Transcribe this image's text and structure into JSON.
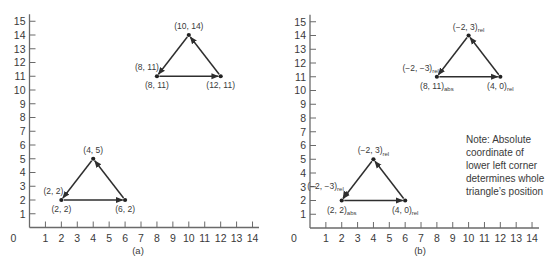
{
  "figure": {
    "panels": [
      {
        "id": "a",
        "caption": "(a)",
        "x_ticks": [
          "0",
          "1",
          "2",
          "3",
          "4",
          "5",
          "6",
          "7",
          "8",
          "9",
          "10",
          "11",
          "12",
          "13",
          "14"
        ],
        "y_ticks": [
          "1",
          "2",
          "3",
          "4",
          "5",
          "6",
          "7",
          "8",
          "9",
          "10",
          "11",
          "12",
          "13",
          "14",
          "15"
        ],
        "x_range": [
          0,
          14
        ],
        "y_range": [
          0,
          15
        ],
        "triangles": [
          {
            "name": "lower-triangle",
            "vertices": [
              [
                2,
                2
              ],
              [
                6,
                2
              ],
              [
                4,
                5
              ]
            ],
            "labels": [
              {
                "text": "(2, 2)",
                "sub": "",
                "at": [
                  2,
                  2
                ],
                "pos": "below"
              },
              {
                "text": "(2, 2)",
                "sub": "",
                "at": [
                  2,
                  2
                ],
                "pos": "above-left"
              },
              {
                "text": "(6, 2)",
                "sub": "",
                "at": [
                  6,
                  2
                ],
                "pos": "below"
              },
              {
                "text": "(4, 5)",
                "sub": "",
                "at": [
                  4,
                  5
                ],
                "pos": "above"
              }
            ]
          },
          {
            "name": "upper-triangle",
            "vertices": [
              [
                8,
                11
              ],
              [
                12,
                11
              ],
              [
                10,
                14
              ]
            ],
            "labels": [
              {
                "text": "(8, 11)",
                "sub": "",
                "at": [
                  8,
                  11
                ],
                "pos": "below"
              },
              {
                "text": "(8, 11)",
                "sub": "",
                "at": [
                  8,
                  11
                ],
                "pos": "above-left"
              },
              {
                "text": "(12, 11)",
                "sub": "",
                "at": [
                  12,
                  11
                ],
                "pos": "below"
              },
              {
                "text": "(10, 14)",
                "sub": "",
                "at": [
                  10,
                  14
                ],
                "pos": "above"
              }
            ]
          }
        ]
      },
      {
        "id": "b",
        "caption": "(b)",
        "x_ticks": [
          "0",
          "1",
          "2",
          "3",
          "4",
          "5",
          "6",
          "7",
          "8",
          "9",
          "10",
          "11",
          "12",
          "13",
          "14"
        ],
        "y_ticks": [
          "1",
          "2",
          "3",
          "4",
          "5",
          "6",
          "7",
          "8",
          "9",
          "10",
          "11",
          "12",
          "13",
          "14",
          "15"
        ],
        "x_range": [
          0,
          14
        ],
        "y_range": [
          0,
          15
        ],
        "triangles": [
          {
            "name": "lower-triangle",
            "vertices": [
              [
                2,
                2
              ],
              [
                6,
                2
              ],
              [
                4,
                5
              ]
            ],
            "labels": [
              {
                "text": "(2, 2)",
                "sub": "abs",
                "at": [
                  2,
                  2
                ],
                "pos": "below"
              },
              {
                "text": "(−2, −3)",
                "sub": "rel",
                "at": [
                  2,
                  2
                ],
                "pos": "above-left-far"
              },
              {
                "text": "(4, 0)",
                "sub": "rel",
                "at": [
                  6,
                  2
                ],
                "pos": "below"
              },
              {
                "text": "(−2, 3)",
                "sub": "rel",
                "at": [
                  4,
                  5
                ],
                "pos": "above"
              }
            ]
          },
          {
            "name": "upper-triangle",
            "vertices": [
              [
                8,
                11
              ],
              [
                12,
                11
              ],
              [
                10,
                14
              ]
            ],
            "labels": [
              {
                "text": "(8, 11)",
                "sub": "abs",
                "at": [
                  8,
                  11
                ],
                "pos": "below"
              },
              {
                "text": "(−2, −3)",
                "sub": "rel",
                "at": [
                  8,
                  11
                ],
                "pos": "above-left"
              },
              {
                "text": "(4, 0)",
                "sub": "rel",
                "at": [
                  12,
                  11
                ],
                "pos": "below"
              },
              {
                "text": "(−2, 3)",
                "sub": "rel",
                "at": [
                  10,
                  14
                ],
                "pos": "above"
              }
            ]
          }
        ],
        "note": [
          "Note:  Absolute",
          "coordinate of",
          "lower left corner",
          "determines whole",
          "triangle’s position"
        ]
      }
    ]
  }
}
